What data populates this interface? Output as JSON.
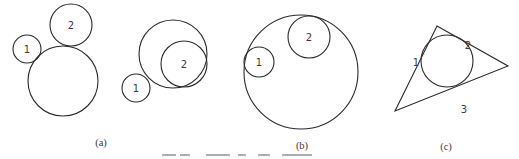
{
  "figure": {
    "panels": [
      {
        "label": "(a)",
        "groups": [
          {
            "name": "external-tangent-circles",
            "circles": [
              {
                "label": "1",
                "cx": 27,
                "cy": 49,
                "r": 14
              },
              {
                "label": "2",
                "cx": 71,
                "cy": 25,
                "r": 21
              },
              {
                "label": "",
                "cx": 63,
                "cy": 81,
                "r": 35
              }
            ]
          },
          {
            "name": "internal-tangent-circles",
            "circles": [
              {
                "label": "",
                "cx": 173,
                "cy": 54,
                "r": 34
              },
              {
                "label": "2",
                "cx": 183,
                "cy": 63,
                "r": 23
              },
              {
                "label": "1",
                "cx": 136,
                "cy": 88,
                "r": 14
              }
            ]
          }
        ]
      },
      {
        "label": "(b)",
        "circles": [
          {
            "label": "",
            "cx": 301,
            "cy": 72,
            "r": 57
          },
          {
            "label": "1",
            "cx": 260,
            "cy": 62,
            "r": 15
          },
          {
            "label": "2",
            "cx": 309,
            "cy": 37,
            "r": 21
          }
        ]
      },
      {
        "label": "(c)",
        "triangle": [
          [
            438,
            26
          ],
          [
            508,
            66
          ],
          [
            395,
            111
          ]
        ],
        "incircle": {
          "cx": 447,
          "cy": 61,
          "r": 26
        },
        "tangent_labels": [
          "1",
          "2",
          "3"
        ]
      }
    ]
  },
  "labels": {
    "a_circle1": "1",
    "a_circle2": "2",
    "a2_circle1": "1",
    "a2_circle2": "2",
    "b_circle1": "1",
    "b_circle2": "2",
    "c_point1": "1",
    "c_point2": "2",
    "c_point3": "3",
    "panel_a": "(a)",
    "panel_b": "(b)",
    "panel_c": "(c)"
  },
  "colors": {
    "stroke": "#2a2a2a",
    "text": "#3a3a3a",
    "background": "#ffffff"
  }
}
